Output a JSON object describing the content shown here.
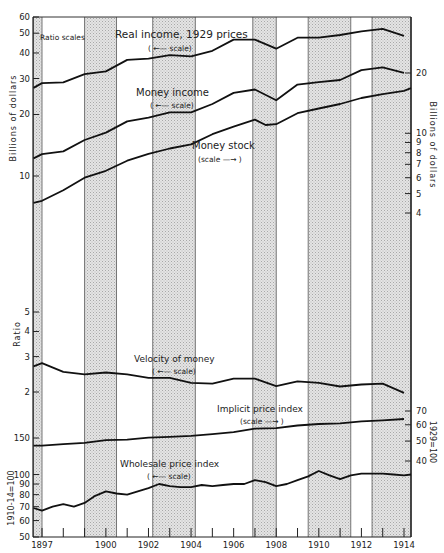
{
  "chart_data": {
    "type": "line",
    "note": "Ratio scales",
    "x_axis": {
      "label": "",
      "ticks": [
        "1897",
        "1900",
        "1902",
        "1904",
        "1906",
        "1908",
        "1910",
        "1912",
        "1914"
      ],
      "range": [
        1896.6,
        1914.4
      ]
    },
    "shaded_periods": [
      [
        1896.6,
        1897.0
      ],
      [
        1899.0,
        1900.5
      ],
      [
        1902.2,
        1904.2
      ],
      [
        1906.9,
        1908.0
      ],
      [
        1909.5,
        1911.5
      ],
      [
        1912.5,
        1914.4
      ]
    ],
    "left_axes": [
      {
        "label": "Billions of dollars",
        "ticks": [
          "10",
          "20",
          "30",
          "40",
          "50",
          "60"
        ]
      },
      {
        "label": "Ratio",
        "ticks": [
          "2",
          "3",
          "4",
          "5"
        ]
      },
      {
        "label": "1910-14=100",
        "ticks": [
          "50",
          "60",
          "70",
          "80",
          "90",
          "100",
          "150"
        ]
      }
    ],
    "right_axes": [
      {
        "label": "Billions of dollars",
        "ticks": [
          "4",
          "5",
          "6",
          "7",
          "8",
          "9",
          "10",
          "20"
        ]
      },
      {
        "label": "1929=100",
        "ticks": [
          "40",
          "50",
          "60",
          "70"
        ]
      }
    ],
    "series": [
      {
        "name": "Real income, 1929 prices",
        "scale_note": "(← scale)",
        "unit": "billions of dollars",
        "x": [
          1896.6,
          1897,
          1898,
          1899,
          1900,
          1901,
          1902,
          1903,
          1904,
          1905,
          1906,
          1907,
          1908,
          1909,
          1910,
          1911,
          1912,
          1913,
          1914
        ],
        "values": [
          27,
          28.5,
          28.7,
          31.5,
          32.5,
          37,
          37.5,
          39,
          38.5,
          41,
          46.5,
          46.5,
          42,
          47.5,
          47.5,
          49,
          51,
          52.5,
          48.5
        ]
      },
      {
        "name": "Money income",
        "scale_note": "(← scale)",
        "unit": "billions of dollars",
        "x": [
          1896.6,
          1897,
          1898,
          1899,
          1900,
          1901,
          1902,
          1903,
          1904,
          1905,
          1906,
          1907,
          1908,
          1909,
          1910,
          1911,
          1912,
          1913,
          1914
        ],
        "values": [
          12.2,
          12.8,
          13.2,
          15,
          16.3,
          18.5,
          19.3,
          20.5,
          20.5,
          22.5,
          25.5,
          26.5,
          23.5,
          28,
          28.8,
          29.5,
          33,
          34,
          32
        ]
      },
      {
        "name": "Money stock",
        "scale_note": "(scale →)",
        "unit": "billions of dollars",
        "x": [
          1896.6,
          1897,
          1898,
          1899,
          1900,
          1901,
          1902,
          1903,
          1904,
          1905,
          1906,
          1907,
          1907.5,
          1908,
          1909,
          1910,
          1911,
          1912,
          1913,
          1914,
          1914.4
        ],
        "values": [
          4.5,
          4.6,
          5.2,
          6.0,
          6.5,
          7.3,
          7.9,
          8.4,
          8.8,
          9.9,
          10.8,
          11.7,
          11.0,
          11.1,
          12.6,
          13.3,
          14.0,
          15.0,
          15.7,
          16.3,
          16.8
        ]
      },
      {
        "name": "Velocity of money",
        "scale_note": "(← scale)",
        "unit": "ratio",
        "x": [
          1896.6,
          1897,
          1898,
          1899,
          1900,
          1901,
          1902,
          1903,
          1904,
          1905,
          1906,
          1907,
          1908,
          1909,
          1910,
          1911,
          1912,
          1913,
          1914
        ],
        "values": [
          2.68,
          2.78,
          2.52,
          2.45,
          2.5,
          2.45,
          2.35,
          2.35,
          2.22,
          2.2,
          2.33,
          2.33,
          2.14,
          2.26,
          2.22,
          2.13,
          2.18,
          2.2,
          1.98
        ]
      },
      {
        "name": "Implicit price index",
        "scale_note": "(scale →)",
        "unit": "1929=100",
        "x": [
          1896.6,
          1897,
          1898,
          1899,
          1900,
          1901,
          1902,
          1903,
          1904,
          1905,
          1906,
          1907,
          1908,
          1909,
          1910,
          1911,
          1912,
          1913,
          1914
        ],
        "values": [
          47.5,
          47.5,
          48.3,
          49,
          50.5,
          50.8,
          52,
          52.4,
          53,
          54,
          55.3,
          57.5,
          57.8,
          59.5,
          60.5,
          61,
          62.3,
          63,
          64
        ]
      },
      {
        "name": "Wholesale price index",
        "scale_note": "(← scale)",
        "unit": "1910-14=100",
        "x": [
          1896.6,
          1897,
          1897.5,
          1898,
          1898.5,
          1899,
          1899.5,
          1900,
          1900.5,
          1901,
          1901.5,
          1902,
          1902.5,
          1903,
          1903.5,
          1904,
          1904.5,
          1905,
          1905.5,
          1906,
          1906.5,
          1907,
          1907.5,
          1908,
          1908.5,
          1909,
          1909.5,
          1910,
          1910.5,
          1911,
          1911.5,
          1912,
          1912.5,
          1913,
          1913.5,
          1914,
          1914.4
        ],
        "values": [
          69,
          67,
          70,
          72,
          70,
          73,
          79,
          83,
          81,
          80,
          83,
          86,
          90,
          88,
          87,
          87,
          89,
          88,
          89,
          90,
          90,
          94,
          92,
          88,
          90,
          94,
          98,
          104,
          99,
          95,
          99,
          101,
          101,
          101,
          100,
          99,
          100
        ]
      }
    ]
  },
  "labels": {
    "ratio_scales": "Ratio scales",
    "real_income": "Real income, 1929 prices",
    "real_income_scale": "( ←— scale)",
    "money_income": "Money income",
    "money_income_scale": "( ←— scale)",
    "money_stock": "Money stock",
    "money_stock_scale": "(scale —→ )",
    "velocity": "Velocity of money",
    "velocity_scale": "( ←— scale)",
    "implicit": "Implicit price index",
    "implicit_scale": "(scale —→ )",
    "wholesale": "Wholesale price index",
    "wholesale_scale": "( ←— scale)",
    "left_axis_billions": "Billions of dollars",
    "left_axis_ratio": "Ratio",
    "left_axis_index": "1910-14=100",
    "right_axis_billions": "Billions of dollars",
    "right_axis_index": "1929=100"
  }
}
